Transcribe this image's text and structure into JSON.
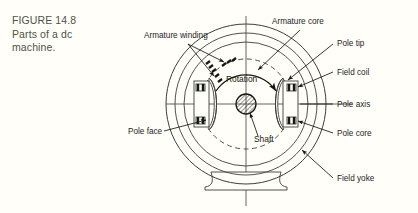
{
  "figure": {
    "caption_lines": [
      "FIGURE 14.8",
      "Parts of a dc",
      "machine."
    ],
    "caption_color": "#4e5347",
    "background_color": "#fffef8",
    "line_color": "#3c4038",
    "ink_color": "#16180f"
  },
  "diagram": {
    "title": "Parts of a dc machine",
    "labels": {
      "armature_winding": "Armature winding",
      "armature_core": "Armature core",
      "pole_tip": "Pole tip",
      "field_coil": "Field coil",
      "pole_axis": "Pole axis",
      "pole_core": "Pole core",
      "field_yoke": "Field yoke",
      "pole_face": "Pole face",
      "rotation": "Rotation",
      "shaft": "Shaft"
    },
    "parts": [
      {
        "name": "armature-winding",
        "label": "Armature winding",
        "side": "left-top"
      },
      {
        "name": "armature-core",
        "label": "Armature core",
        "side": "right-top"
      },
      {
        "name": "pole-tip",
        "label": "Pole tip",
        "side": "right-top"
      },
      {
        "name": "field-coil",
        "label": "Field coil",
        "side": "right"
      },
      {
        "name": "pole-axis",
        "label": "Pole axis",
        "side": "right"
      },
      {
        "name": "pole-core",
        "label": "Pole core",
        "side": "right"
      },
      {
        "name": "field-yoke",
        "label": "Field yoke",
        "side": "right-bottom"
      },
      {
        "name": "pole-face",
        "label": "Pole face",
        "side": "left"
      },
      {
        "name": "rotation",
        "label": "Rotation",
        "side": "center"
      },
      {
        "name": "shaft",
        "label": "Shaft",
        "side": "center"
      }
    ]
  }
}
